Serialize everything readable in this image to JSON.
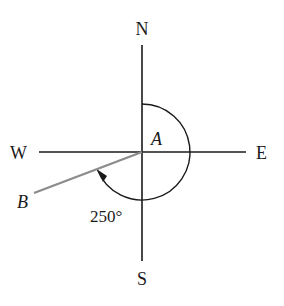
{
  "diagram": {
    "type": "compass-bearing",
    "directions": {
      "north": "N",
      "south": "S",
      "east": "E",
      "west": "W"
    },
    "points": {
      "a_label": "A",
      "b_label": "B"
    },
    "angle_label": "250°",
    "bearing_degrees": 250,
    "colors": {
      "axes": "#1a1a1a",
      "ray_b": "#8c8c8c",
      "arc": "#1a1a1a"
    }
  }
}
